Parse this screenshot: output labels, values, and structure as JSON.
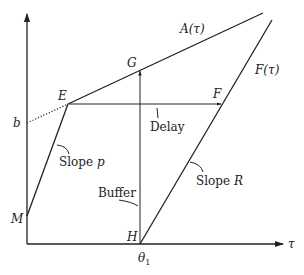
{
  "diagram": {
    "axes": {
      "x_label": "τ",
      "y_label": ""
    },
    "curves": {
      "arrival": "A(τ)",
      "departure": "F(τ)"
    },
    "points": {
      "E": "E",
      "F": "F",
      "G": "G",
      "H": "H",
      "M": "M",
      "b": "b",
      "theta1": "θ",
      "theta1_sub": "1"
    },
    "annotations": {
      "delay": "Delay",
      "buffer": "Buffer",
      "slope_p_word": "Slope ",
      "slope_p_var": "p",
      "slope_r_word": "Slope ",
      "slope_r_var": "R"
    },
    "colors": {
      "ink": "#222222",
      "background": "#ffffff"
    }
  }
}
